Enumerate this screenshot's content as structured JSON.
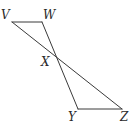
{
  "diagram": {
    "type": "geometry",
    "stroke_color": "#3a3a3a",
    "points": {
      "V": {
        "label": "V",
        "x": 12,
        "y": 22,
        "lx": 1,
        "ly": 19
      },
      "W": {
        "label": "W",
        "x": 42,
        "y": 22,
        "lx": 43,
        "ly": 19
      },
      "X": {
        "label": "X",
        "x": 57,
        "y": 58,
        "lx": 41,
        "ly": 66
      },
      "Y": {
        "label": "Y",
        "x": 78,
        "y": 109,
        "lx": 68,
        "ly": 121
      },
      "Z": {
        "label": "Z",
        "x": 122,
        "y": 109,
        "lx": 120,
        "ly": 121
      }
    },
    "segments": [
      {
        "name": "segment-vw",
        "from": "V",
        "to": "W"
      },
      {
        "name": "segment-vz",
        "from": "V",
        "to": "Z"
      },
      {
        "name": "segment-wy",
        "from": "W",
        "to": "Y"
      },
      {
        "name": "segment-yz",
        "from": "Y",
        "to": "Z"
      }
    ]
  }
}
